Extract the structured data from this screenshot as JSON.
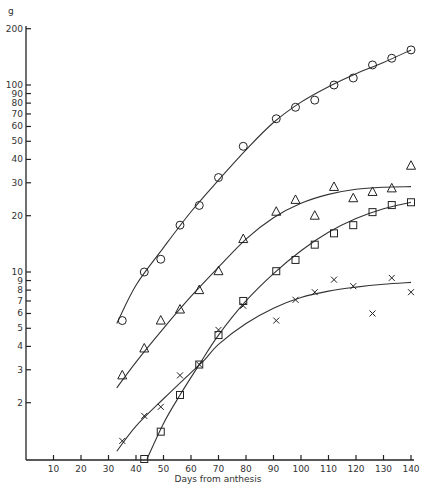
{
  "chart_data": {
    "type": "scatter",
    "title": "",
    "xlabel": "Days from anthesis",
    "ylabel": "g",
    "yscale": "log",
    "xlim": [
      0,
      142
    ],
    "ylim": [
      1,
      200
    ],
    "grid": false,
    "legend": null,
    "x_ticks": [
      10,
      20,
      30,
      40,
      50,
      60,
      70,
      80,
      90,
      100,
      110,
      120,
      130,
      140
    ],
    "y_ticks": [
      {
        "v": 200,
        "label": "200"
      },
      {
        "v": 100,
        "label": "100"
      },
      {
        "v": 90,
        "label": "90"
      },
      {
        "v": 80,
        "label": "80"
      },
      {
        "v": 70,
        "label": "70"
      },
      {
        "v": 60,
        "label": "60"
      },
      {
        "v": 50,
        "label": "50"
      },
      {
        "v": 40,
        "label": "40"
      },
      {
        "v": 30,
        "label": "30"
      },
      {
        "v": 20,
        "label": "20"
      },
      {
        "v": 10,
        "label": "10"
      },
      {
        "v": 9,
        "label": "9"
      },
      {
        "v": 8,
        "label": "8"
      },
      {
        "v": 7,
        "label": "7"
      },
      {
        "v": 6,
        "label": "6"
      },
      {
        "v": 5,
        "label": "5"
      },
      {
        "v": 4,
        "label": "4"
      },
      {
        "v": 3,
        "label": "3"
      },
      {
        "v": 2,
        "label": "2"
      }
    ],
    "series": [
      {
        "name": "circles",
        "marker": "circle",
        "x": [
          35,
          43,
          49,
          56,
          63,
          70,
          79,
          91,
          98,
          105,
          112,
          119,
          126,
          133,
          140
        ],
        "y": [
          5.5,
          10,
          11.7,
          17.8,
          22.7,
          32,
          47,
          66,
          76,
          83,
          100,
          109,
          128,
          139,
          154
        ],
        "curve": [
          [
            33,
            5.3
          ],
          [
            40,
            8.5
          ],
          [
            50,
            13.5
          ],
          [
            60,
            21
          ],
          [
            70,
            31
          ],
          [
            80,
            45
          ],
          [
            90,
            63
          ],
          [
            100,
            81
          ],
          [
            110,
            98
          ],
          [
            120,
            115
          ],
          [
            130,
            132
          ],
          [
            140,
            154
          ]
        ]
      },
      {
        "name": "triangles",
        "marker": "triangle",
        "x": [
          35,
          43,
          49,
          56,
          63,
          70,
          79,
          91,
          98,
          105,
          112,
          119,
          126,
          133,
          140
        ],
        "y": [
          2.8,
          3.9,
          5.5,
          6.3,
          8.0,
          10.1,
          15,
          21,
          24.3,
          20,
          28.5,
          24.8,
          26.8,
          28,
          37
        ],
        "curve": [
          [
            33,
            2.4
          ],
          [
            40,
            3.3
          ],
          [
            50,
            5.0
          ],
          [
            60,
            7.4
          ],
          [
            70,
            10.6
          ],
          [
            80,
            15
          ],
          [
            90,
            19.5
          ],
          [
            100,
            23.3
          ],
          [
            110,
            26
          ],
          [
            120,
            27.7
          ],
          [
            130,
            28.4
          ],
          [
            140,
            28.6
          ]
        ]
      },
      {
        "name": "squares",
        "marker": "square",
        "x": [
          43,
          49,
          56,
          63,
          70,
          79,
          91,
          98,
          105,
          112,
          119,
          126,
          133,
          140
        ],
        "y": [
          1.0,
          1.4,
          2.2,
          3.2,
          4.6,
          7.0,
          10.1,
          11.6,
          14,
          16.1,
          17.8,
          20.9,
          22.8,
          23.6
        ],
        "curve": [
          [
            44,
            1.0
          ],
          [
            50,
            1.55
          ],
          [
            56,
            2.2
          ],
          [
            63,
            3.2
          ],
          [
            70,
            4.6
          ],
          [
            80,
            7.0
          ],
          [
            90,
            9.8
          ],
          [
            100,
            13
          ],
          [
            110,
            16.3
          ],
          [
            120,
            19.3
          ],
          [
            130,
            21.8
          ],
          [
            140,
            23.6
          ]
        ]
      },
      {
        "name": "crosses",
        "marker": "cross",
        "x": [
          35,
          43,
          49,
          56,
          63,
          70,
          79,
          91,
          98,
          105,
          112,
          119,
          126,
          133,
          140
        ],
        "y": [
          1.25,
          1.7,
          1.9,
          2.8,
          3.2,
          4.9,
          6.6,
          5.5,
          7.1,
          7.8,
          9.1,
          8.4,
          6.0,
          9.3,
          7.8
        ],
        "curve": [
          [
            33,
            1.1
          ],
          [
            40,
            1.5
          ],
          [
            50,
            2.1
          ],
          [
            60,
            2.9
          ],
          [
            65,
            3.4
          ],
          [
            70,
            4.1
          ],
          [
            80,
            5.3
          ],
          [
            90,
            6.4
          ],
          [
            100,
            7.3
          ],
          [
            110,
            7.9
          ],
          [
            120,
            8.3
          ],
          [
            130,
            8.6
          ],
          [
            140,
            8.8
          ]
        ]
      }
    ]
  },
  "axes": {
    "ylabel": "g",
    "xlabel": "Days from anthesis"
  }
}
